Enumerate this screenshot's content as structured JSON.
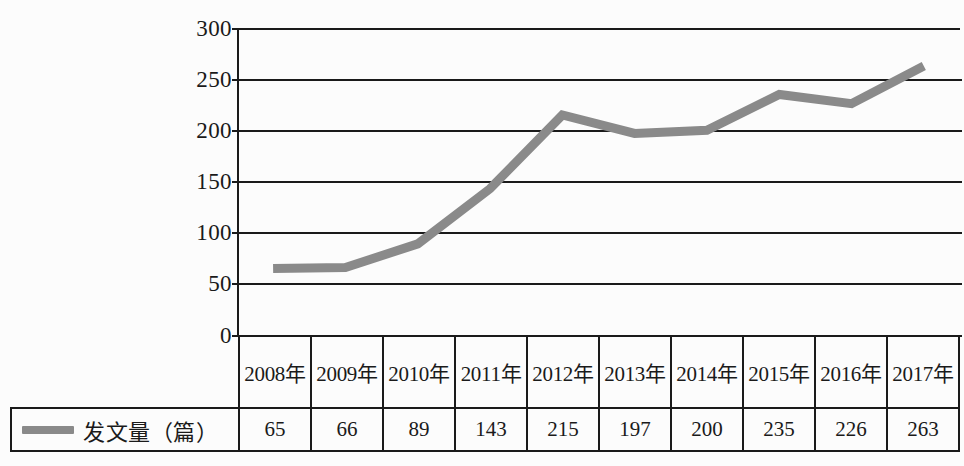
{
  "chart_data": {
    "type": "line",
    "title": "",
    "xlabel": "",
    "ylabel": "",
    "categories": [
      "2008年",
      "2009年",
      "2010年",
      "2011年",
      "2012年",
      "2013年",
      "2014年",
      "2015年",
      "2016年",
      "2017年"
    ],
    "series": [
      {
        "name": "发文量（篇）",
        "values": [
          65,
          66,
          89,
          143,
          215,
          197,
          200,
          235,
          226,
          263
        ],
        "color": "#8a8a8a"
      }
    ],
    "ylim": [
      0,
      300
    ],
    "yticks": [
      "0",
      "50",
      "100",
      "150",
      "200",
      "250",
      "300"
    ],
    "grid": true,
    "legend_position": "bottom-left-table"
  },
  "axis": {
    "y_ticks": [
      "300",
      "250",
      "200",
      "150",
      "100",
      "50",
      "0"
    ]
  },
  "table": {
    "header_row": [
      "2008年",
      "2009年",
      "2010年",
      "2011年",
      "2012年",
      "2013年",
      "2014年",
      "2015年",
      "2016年",
      "2017年"
    ],
    "legend_label": "发文量（篇）",
    "value_row": [
      "65",
      "66",
      "89",
      "143",
      "215",
      "197",
      "200",
      "235",
      "226",
      "263"
    ]
  },
  "colors": {
    "series_line": "#8a8a8a",
    "axis": "#1a1a1a",
    "background": "#fcfcfc"
  }
}
